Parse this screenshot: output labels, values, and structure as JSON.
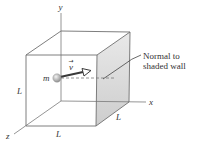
{
  "figure": {
    "type": "physics-diagram",
    "colors": {
      "edge": "#6f6f6f",
      "shaded_wall_top": "#e8e8e8",
      "shaded_wall_bottom": "#cfcfcf",
      "arrow": "#3a3a3a",
      "ball": "#b5b5b5",
      "text": "#333333"
    },
    "axes": {
      "x": "x",
      "y": "y",
      "z": "z"
    },
    "edge_labels": {
      "left": "L",
      "bottom": "L",
      "depth": "L"
    },
    "particle": {
      "mass_label": "m",
      "velocity_label": "v",
      "velocity_arrow_symbol": "→"
    },
    "annotation": {
      "line1": "Normal to",
      "line2": "shaded wall"
    }
  }
}
